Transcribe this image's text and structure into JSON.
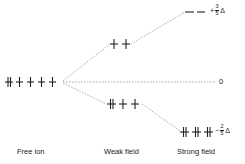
{
  "diagram": {
    "columns": [
      {
        "id": "free_ion",
        "label": "Free ion"
      },
      {
        "id": "weak_field",
        "label": "Weak field"
      },
      {
        "id": "strong_field",
        "label": "Strong field"
      }
    ],
    "levels": {
      "free_ion": {
        "electrons": [
          "paired",
          "up",
          "up",
          "up",
          "up"
        ],
        "energy": "0"
      },
      "weak_field_upper": {
        "electrons": [
          "up",
          "up"
        ]
      },
      "weak_field_lower": {
        "electrons": [
          "paired",
          "up",
          "up"
        ]
      },
      "strong_field_upper": {
        "electrons": [
          "empty",
          "empty"
        ]
      },
      "strong_field_lower": {
        "electrons": [
          "paired",
          "paired",
          "paired"
        ]
      }
    },
    "energy_labels": {
      "upper": {
        "sign": "+",
        "numerator": "3",
        "denominator": "5",
        "symbol": "Δ"
      },
      "zero": "0",
      "lower": {
        "sign": "−",
        "numerator": "2",
        "denominator": "5",
        "symbol": "Δ"
      }
    },
    "colors": {
      "line": "#222222",
      "dash": "#888888",
      "background": "#ffffff"
    }
  }
}
